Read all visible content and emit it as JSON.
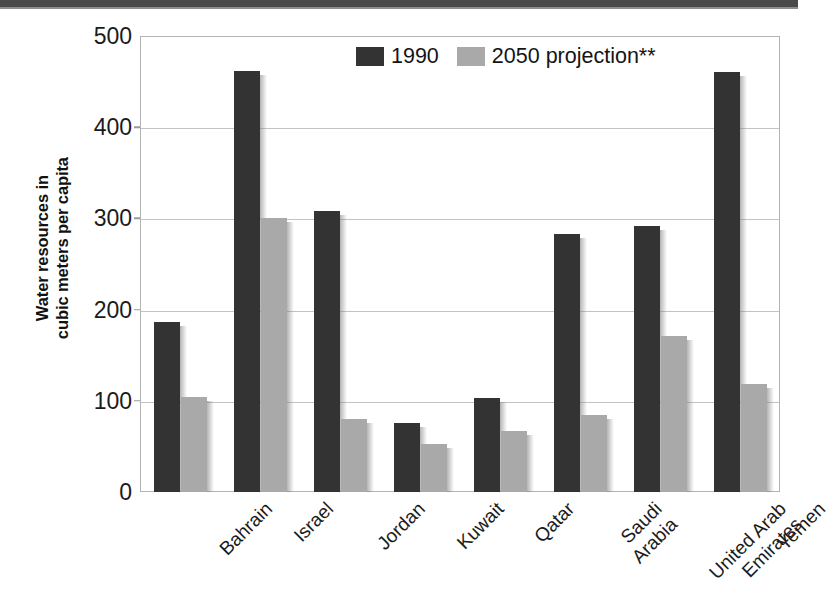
{
  "chart_data": {
    "type": "bar",
    "title": "",
    "xlabel": "",
    "ylabel": "Water resources in cubic meters per capita",
    "ylabel_lines": [
      "Water resources in",
      "cubic meters per capita"
    ],
    "ylim": [
      0,
      500
    ],
    "y_ticks": [
      0,
      100,
      200,
      300,
      400,
      500
    ],
    "y_tick_labels": [
      "0",
      "100",
      "200",
      "300",
      "400",
      "500"
    ],
    "grid": true,
    "grid_axis": "y",
    "legend_position": "top-center",
    "categories": [
      "Bahrain",
      "Israel",
      "Jordan",
      "Kuwait",
      "Qatar",
      "Saudi Arabia",
      "United Arab Emirates",
      "Yemen"
    ],
    "category_label_lines": [
      [
        "Bahrain"
      ],
      [
        "Israel"
      ],
      [
        "Jordan"
      ],
      [
        "Kuwait"
      ],
      [
        "Qatar"
      ],
      [
        "Saudi",
        "Arabia"
      ],
      [
        "United Arab",
        "Emirates"
      ],
      [
        "Yemen"
      ]
    ],
    "series": [
      {
        "name": "1990",
        "color": "#333333",
        "values": [
          186,
          462,
          308,
          76,
          103,
          283,
          292,
          460
        ]
      },
      {
        "name": "2050 projection**",
        "color": "#a9a9a9",
        "values": [
          104,
          300,
          80,
          53,
          67,
          84,
          171,
          118
        ]
      }
    ],
    "annotations": [
      "**"
    ]
  },
  "legend": {
    "items": [
      {
        "label": "1990",
        "color": "#333333",
        "swatch_name": "legend-swatch-1990"
      },
      {
        "label": "2050 projection**",
        "color": "#a9a9a9",
        "swatch_name": "legend-swatch-2050"
      }
    ]
  },
  "colors": {
    "series_1990": "#333333",
    "series_2050": "#a9a9a9",
    "gridline": "#c3c3c3",
    "frame": "#b4b4b4",
    "text": "#1b1b1b",
    "scan_band": "#4a4a4a",
    "background": "#ffffff"
  }
}
